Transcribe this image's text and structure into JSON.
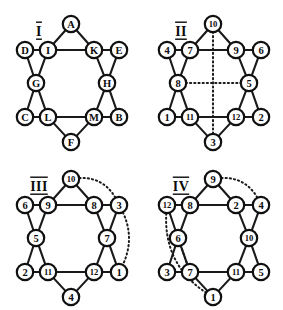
{
  "figure": {
    "panel_count": 4,
    "background_color": "#ffffff",
    "ink_color": "#101010",
    "node_fill": "#ffffff"
  },
  "geometry": {
    "node_radius": 8.2,
    "positions": {
      "top": {
        "x": 71,
        "y": 24
      },
      "upper_left": {
        "x": 25,
        "y": 50
      },
      "upper_inner_l": {
        "x": 48,
        "y": 50
      },
      "upper_inner_r": {
        "x": 94,
        "y": 50
      },
      "upper_right": {
        "x": 119,
        "y": 50
      },
      "mid_left": {
        "x": 36,
        "y": 83
      },
      "mid_right": {
        "x": 107,
        "y": 83
      },
      "lower_left": {
        "x": 25,
        "y": 117
      },
      "lower_inner_l": {
        "x": 48,
        "y": 117
      },
      "lower_inner_r": {
        "x": 94,
        "y": 117
      },
      "lower_right": {
        "x": 119,
        "y": 117
      },
      "bottom": {
        "x": 71,
        "y": 142
      }
    },
    "solid_edges": [
      [
        "top",
        "upper_inner_l"
      ],
      [
        "top",
        "upper_inner_r"
      ],
      [
        "upper_inner_l",
        "upper_inner_r"
      ],
      [
        "upper_left",
        "upper_inner_l"
      ],
      [
        "upper_inner_r",
        "upper_right"
      ],
      [
        "upper_left",
        "mid_left"
      ],
      [
        "upper_inner_l",
        "mid_left"
      ],
      [
        "upper_right",
        "mid_right"
      ],
      [
        "upper_inner_r",
        "mid_right"
      ],
      [
        "mid_left",
        "lower_left"
      ],
      [
        "mid_left",
        "lower_inner_l"
      ],
      [
        "mid_right",
        "lower_right"
      ],
      [
        "mid_right",
        "lower_inner_r"
      ],
      [
        "lower_left",
        "lower_inner_l"
      ],
      [
        "lower_inner_l",
        "lower_inner_r"
      ],
      [
        "lower_inner_r",
        "lower_right"
      ],
      [
        "lower_inner_l",
        "bottom"
      ],
      [
        "lower_inner_r",
        "bottom"
      ]
    ]
  },
  "panels": [
    {
      "id": "I",
      "title": "I",
      "title_pos": {
        "x": 39,
        "y": 31
      },
      "labels": {
        "top": "A",
        "upper_left": "D",
        "upper_inner_l": "I",
        "upper_inner_r": "K",
        "upper_right": "E",
        "mid_left": "G",
        "mid_right": "H",
        "lower_left": "C",
        "lower_inner_l": "L",
        "lower_inner_r": "M",
        "lower_right": "B",
        "bottom": "F"
      },
      "dotted_edges": []
    },
    {
      "id": "II",
      "title": "II",
      "title_pos": {
        "x": 39,
        "y": 31
      },
      "labels": {
        "top": "10",
        "upper_left": "4",
        "upper_inner_l": "7",
        "upper_inner_r": "9",
        "upper_right": "6",
        "mid_left": "8",
        "mid_right": "5",
        "lower_left": "1",
        "lower_inner_l": "11",
        "lower_inner_r": "12",
        "lower_right": "2",
        "bottom": "3"
      },
      "dotted_edges": [
        {
          "type": "line",
          "from": "top",
          "to": "bottom"
        },
        {
          "type": "line",
          "from": "mid_left",
          "to": "mid_right"
        }
      ]
    },
    {
      "id": "III",
      "title": "III",
      "title_pos": {
        "x": 39,
        "y": 31
      },
      "labels": {
        "top": "10",
        "upper_left": "6",
        "upper_inner_l": "9",
        "upper_inner_r": "8",
        "upper_right": "3",
        "mid_left": "5",
        "mid_right": "7",
        "lower_left": "2",
        "lower_inner_l": "11",
        "lower_inner_r": "12",
        "lower_right": "1",
        "bottom": "4"
      },
      "dotted_edges": [
        {
          "type": "arc",
          "from": "top",
          "to": "upper_right",
          "bulge": 22
        },
        {
          "type": "line",
          "from": "lower_left",
          "to": "lower_inner_l"
        },
        {
          "type": "line",
          "from": "lower_inner_r",
          "to": "lower_right"
        },
        {
          "type": "arc",
          "from": "upper_right",
          "to": "lower_right",
          "bulge": 20
        }
      ]
    },
    {
      "id": "IV",
      "title": "IV",
      "title_pos": {
        "x": 39,
        "y": 31
      },
      "labels": {
        "top": "9",
        "upper_left": "12",
        "upper_inner_l": "8",
        "upper_inner_r": "2",
        "upper_right": "4",
        "mid_left": "6",
        "mid_right": "10",
        "lower_left": "3",
        "lower_inner_l": "7",
        "lower_inner_r": "11",
        "lower_right": "5",
        "bottom": "1"
      },
      "dotted_edges": [
        {
          "type": "arc",
          "from": "top",
          "to": "upper_right",
          "bulge": 22
        },
        {
          "type": "line",
          "from": "mid_left",
          "to": "lower_inner_l"
        },
        {
          "type": "arc",
          "from": "upper_left",
          "to": "bottom",
          "bulge": 34
        }
      ]
    }
  ]
}
